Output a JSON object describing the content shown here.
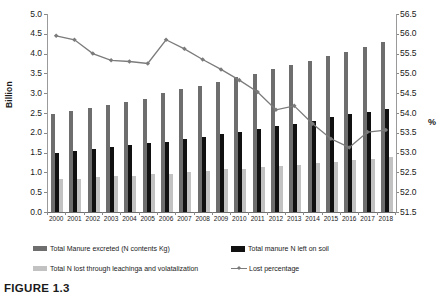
{
  "figure": {
    "caption": "FIGURE 1.3"
  },
  "chart_data": {
    "type": "bar",
    "title": "",
    "xlabel": "",
    "ylabel": "Billion",
    "y2label": "%",
    "ylim": [
      0.0,
      5.0
    ],
    "y2lim": [
      51.5,
      56.5
    ],
    "grid": false,
    "legend_position": "bottom",
    "categories": [
      "2000",
      "2001",
      "2002",
      "2003",
      "2004",
      "2005",
      "2006",
      "2007",
      "2008",
      "2009",
      "2010",
      "2011",
      "2012",
      "2013",
      "2014",
      "2015",
      "2016",
      "2017",
      "2018"
    ],
    "yticks": [
      "0.0",
      "0.5",
      "1.0",
      "1.5",
      "2.0",
      "2.5",
      "3.0",
      "3.5",
      "4.0",
      "4.5",
      "5.0"
    ],
    "y2ticks": [
      "51.5",
      "52.0",
      "52.5",
      "53.0",
      "53.5",
      "54.0",
      "54.5",
      "55.0",
      "55.5",
      "56.0",
      "56.5"
    ],
    "series": [
      {
        "name": "Total Manure excreted (N contents Kg)",
        "type": "bar",
        "axis": "left",
        "color": "#6e6e6e",
        "values": [
          2.48,
          2.56,
          2.62,
          2.7,
          2.77,
          2.85,
          3.0,
          3.1,
          3.19,
          3.28,
          3.4,
          3.49,
          3.6,
          3.71,
          3.82,
          3.93,
          4.05,
          4.16,
          4.3
        ]
      },
      {
        "name": "Total manure N left on soil",
        "type": "bar",
        "axis": "left",
        "color": "#111111",
        "values": [
          1.5,
          1.54,
          1.6,
          1.65,
          1.69,
          1.74,
          1.78,
          1.84,
          1.9,
          1.96,
          2.01,
          2.1,
          2.17,
          2.23,
          2.31,
          2.41,
          2.48,
          2.53,
          2.6
        ]
      },
      {
        "name": "Total N lost through leachinga and volatalization",
        "type": "bar",
        "axis": "left",
        "color": "#c2c2c2",
        "values": [
          0.83,
          0.84,
          0.88,
          0.9,
          0.92,
          0.95,
          0.97,
          1.01,
          1.04,
          1.08,
          1.09,
          1.14,
          1.17,
          1.19,
          1.23,
          1.27,
          1.31,
          1.34,
          1.38
        ]
      },
      {
        "name": "Lost percentage",
        "type": "line",
        "axis": "right",
        "color": "#7b7b7b",
        "values": [
          55.95,
          55.85,
          55.5,
          55.33,
          55.3,
          55.25,
          55.85,
          55.62,
          55.35,
          55.1,
          54.83,
          54.53,
          54.08,
          54.18,
          53.73,
          53.35,
          53.13,
          53.52,
          53.57
        ]
      }
    ]
  },
  "legend": {
    "items": [
      {
        "label": "Total Manure excreted (N contents Kg)",
        "marker": "bar-dark-gray"
      },
      {
        "label": "Total manure N left on soil",
        "marker": "bar-black"
      },
      {
        "label": "Total N lost through leachinga and volatalization",
        "marker": "bar-light-gray"
      },
      {
        "label": "Lost percentage",
        "marker": "line-with-diamond-marker"
      }
    ]
  }
}
